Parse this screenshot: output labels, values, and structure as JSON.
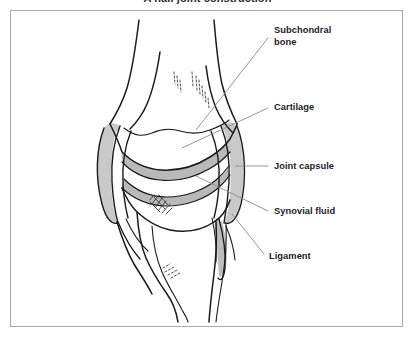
{
  "figure": {
    "title": "A nail joint construction",
    "frame": {
      "border_color": "#a9a9a9",
      "background": "#ffffff"
    }
  },
  "colors": {
    "outline": "#1a1a1a",
    "cartilage_fill": "#b9b9b9",
    "capsule_fill": "#c9c9c9",
    "synovial_fill": "#ffffff",
    "leader_line": "#8a8a8a",
    "label_text": "#23211f",
    "frame_border": "#a9a9a9",
    "page_background": "#ffffff"
  },
  "callouts": [
    {
      "id": "subchondral-bone",
      "label": "Subchondral\nbone",
      "lines": [
        "Subchondral",
        "bone"
      ],
      "label_x": 274,
      "label_y": 25,
      "leader_from": [
        268,
        38
      ],
      "leader_to": [
        196,
        130
      ]
    },
    {
      "id": "cartilage",
      "label": "Cartilage",
      "lines": [
        "Cartilage"
      ],
      "label_x": 274,
      "label_y": 102,
      "leader_from": [
        268,
        108
      ],
      "leader_to": [
        182,
        148
      ]
    },
    {
      "id": "joint-capsule",
      "label": "Joint capsule",
      "lines": [
        "Joint capsule"
      ],
      "label_x": 274,
      "label_y": 161,
      "leader_from": [
        268,
        166
      ],
      "leader_to": [
        236,
        166
      ]
    },
    {
      "id": "synovial-fluid",
      "label": "Synovial fluid",
      "lines": [
        "Synovial fluid"
      ],
      "label_x": 274,
      "label_y": 206,
      "leader_from": [
        268,
        211
      ],
      "leader_to": [
        196,
        176
      ]
    },
    {
      "id": "ligament",
      "label": "Ligament",
      "lines": [
        "Ligament"
      ],
      "label_x": 269,
      "label_y": 251,
      "leader_from": [
        264,
        254
      ],
      "leader_to": [
        232,
        214
      ]
    }
  ],
  "anatomy": {
    "parts": [
      {
        "name": "femur-shaft",
        "description": "upper long bone shaft narrowing toward the top"
      },
      {
        "name": "femoral-condyle",
        "description": "rounded lower end of the femur forming the joint surface"
      },
      {
        "name": "subchondral-bone",
        "description": "dense bone layer directly beneath the cartilage"
      },
      {
        "name": "articular-cartilage-upper",
        "description": "grey shaded band on the femoral condyle"
      },
      {
        "name": "articular-cartilage-lower",
        "description": "grey shaded band on the tibial plateau"
      },
      {
        "name": "synovial-cavity",
        "description": "clear space between the two cartilage bands"
      },
      {
        "name": "joint-capsule-left",
        "description": "elongated lens-shaped sheath on the left side of the joint"
      },
      {
        "name": "joint-capsule-right",
        "description": "elongated lens-shaped sheath on the right side of the joint"
      },
      {
        "name": "tibial-plateau",
        "description": "flat upper surface of the lower bone"
      },
      {
        "name": "tibia-shaft",
        "description": "lower long bone shaft descending to the bottom"
      },
      {
        "name": "fibula-shaft",
        "description": "thin bone running alongside the tibia on the right"
      },
      {
        "name": "ligament-left",
        "description": "fibrous band crossing the left side of the joint"
      },
      {
        "name": "ligament-right",
        "description": "fibrous band crossing the right side of the joint"
      },
      {
        "name": "tendon-attachment-patch",
        "description": "small crosshatched insertion patch below the joint"
      }
    ]
  }
}
